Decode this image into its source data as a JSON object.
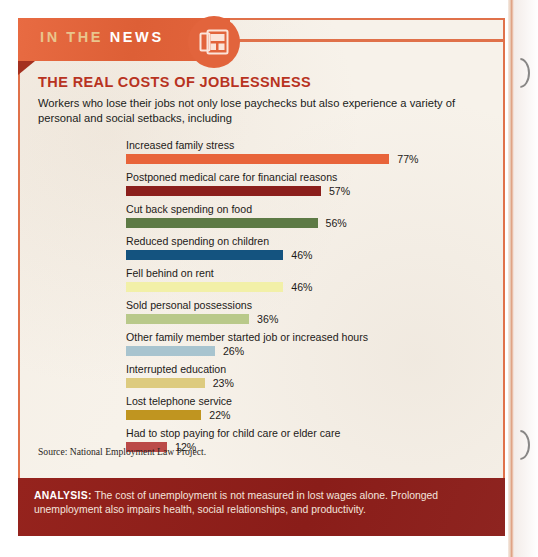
{
  "banner": {
    "label_part1": "IN THE",
    "label_part2": "NEWS",
    "icon": "newspaper-icon",
    "banner_color": "#e2643c",
    "tail_color": "#a4301f"
  },
  "headline": "THE REAL COSTS OF JOBLESSNESS",
  "subhead": "Workers who lose their jobs not only lose paychecks but also experience a variety of personal and social setbacks, including",
  "source": "Source: National Employment Law Project.",
  "analysis": {
    "label": "ANALYSIS:",
    "body": " The cost of unemployment is not measured in lost wages alone. Prolonged unemployment also impairs health, social relationships, and productivity.",
    "background_color": "#8e1f1b"
  },
  "chart_data": {
    "type": "bar",
    "title": "THE REAL COSTS OF JOBLESSNESS",
    "xlabel": "",
    "ylabel": "",
    "xlim": [
      0,
      100
    ],
    "grid": false,
    "legend": "none",
    "orientation": "horizontal",
    "value_suffix": "%",
    "categories": [
      "Increased family stress",
      "Postponed medical care for financial reasons",
      "Cut back spending on food",
      "Reduced spending on children",
      "Fell behind on rent",
      "Sold personal possessions",
      "Other family member started job or increased hours",
      "Interrupted education",
      "Lost telephone service",
      "Had to stop paying for child care or elder care"
    ],
    "values": [
      77,
      57,
      56,
      46,
      46,
      36,
      26,
      23,
      22,
      12
    ],
    "value_labels": [
      "77%",
      "57%",
      "56%",
      "46%",
      "46%",
      "36%",
      "26%",
      "23%",
      "22%",
      "12%"
    ],
    "colors": [
      "#e8643a",
      "#8b1f1c",
      "#5d7a45",
      "#14537f",
      "#f2f0a8",
      "#b9c98a",
      "#a8c4cf",
      "#ddcb7f",
      "#c09520",
      "#bb4a48"
    ]
  }
}
